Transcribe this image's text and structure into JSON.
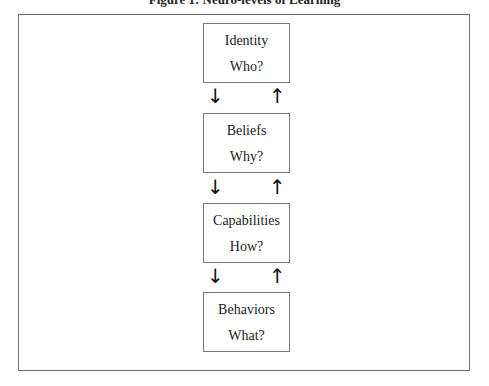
{
  "figure": {
    "title": "Figure 1: Neuro-levels of Learning"
  },
  "levels": [
    {
      "name": "Identity",
      "question": "Who?"
    },
    {
      "name": "Beliefs",
      "question": "Why?"
    },
    {
      "name": "Capabilities",
      "question": "How?"
    },
    {
      "name": "Behaviors",
      "question": "What?"
    }
  ],
  "arrows": {
    "down": "↓",
    "up": "↑"
  }
}
